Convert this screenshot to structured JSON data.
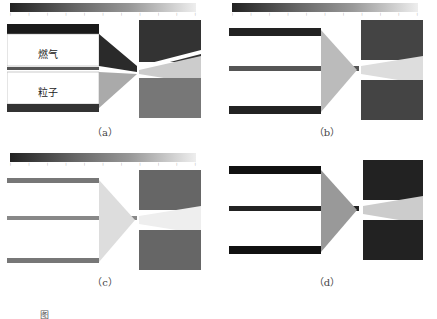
{
  "figure": {
    "panels": [
      {
        "id": "a",
        "label": "（a）",
        "annotations": {
          "gas": "燃气",
          "particles": "粒子"
        },
        "colorbar_ticks": [
          "",
          "",
          "",
          "",
          "",
          "",
          "",
          "",
          "",
          "",
          ""
        ]
      },
      {
        "id": "b",
        "label": "（b）",
        "colorbar_ticks": [
          "",
          "",
          "",
          "",
          "",
          "",
          "",
          "",
          "",
          "",
          ""
        ]
      },
      {
        "id": "c",
        "label": "（c）",
        "colorbar_ticks": [
          "",
          "",
          "",
          "",
          "",
          "",
          "",
          "",
          "",
          "",
          ""
        ]
      },
      {
        "id": "d",
        "label": "（d）"
      }
    ],
    "caption": "图"
  },
  "colors": {
    "dark": "#1a1a1a",
    "mid": "#7a7a7a",
    "light": "#e8e8e8"
  }
}
